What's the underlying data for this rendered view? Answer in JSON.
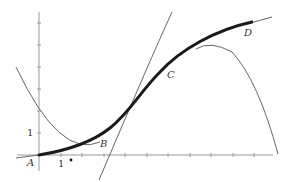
{
  "diagram": {
    "type": "function-graph",
    "colors": {
      "background": "#ffffff",
      "axis": "#9a9a9a",
      "thin_curve": "#555555",
      "bold_curve": "#1a1a1a",
      "text": "#333333"
    },
    "axes": {
      "x_tick_label": "1",
      "y_tick_label": "1",
      "origin_label": "A"
    },
    "points": [
      {
        "label": "A",
        "x": 30,
        "y": 166
      },
      {
        "label": "B",
        "x": 102,
        "y": 146
      },
      {
        "label": "C",
        "x": 170,
        "y": 77
      },
      {
        "label": "D",
        "x": 246,
        "y": 35
      }
    ],
    "marker_dot": {
      "x": 71,
      "y": 160
    }
  }
}
